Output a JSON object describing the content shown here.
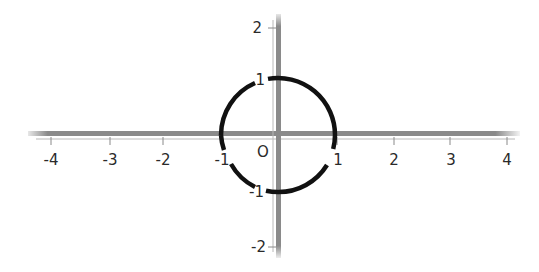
{
  "diagram": {
    "type": "unit-circle-on-cartesian-plane",
    "origin_label": "O",
    "x_axis": {
      "tick_labels": [
        "-4",
        "-3",
        "-2",
        "-1",
        "1",
        "2",
        "3",
        "4"
      ],
      "range": [
        -4,
        4
      ]
    },
    "y_axis": {
      "tick_labels": [
        "2",
        "1",
        "-1",
        "-2"
      ],
      "range": [
        -2,
        2
      ]
    },
    "circle": {
      "center": [
        0,
        0
      ],
      "radius": 1,
      "intercept_labels": {
        "top": "1",
        "right": "1",
        "bottom": "-1",
        "left": "-1"
      }
    },
    "colors": {
      "axis": "#8a8a8a",
      "axis_thin": "#b8b8b8",
      "circle": "#111111",
      "text": "#2a2a2a"
    }
  }
}
